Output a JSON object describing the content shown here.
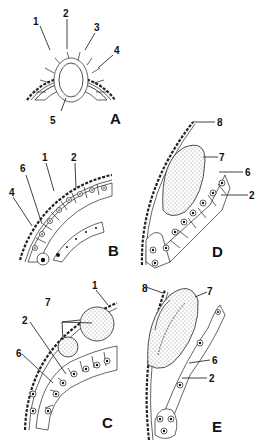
{
  "figure": {
    "panels": [
      {
        "id": "A",
        "label": "A",
        "callouts": [
          "1",
          "2",
          "3",
          "4",
          "5"
        ]
      },
      {
        "id": "B",
        "label": "B",
        "callouts": [
          "6",
          "1",
          "2",
          "4"
        ]
      },
      {
        "id": "C",
        "label": "C",
        "callouts": [
          "1",
          "7",
          "2",
          "6"
        ]
      },
      {
        "id": "D",
        "label": "D",
        "callouts": [
          "8",
          "7",
          "6",
          "2"
        ]
      },
      {
        "id": "E",
        "label": "E",
        "callouts": [
          "8",
          "7",
          "6",
          "2"
        ]
      }
    ]
  },
  "labels": {
    "A": {
      "panel": "A",
      "n1": "1",
      "n2": "2",
      "n3": "3",
      "n4": "4",
      "n5": "5"
    },
    "B": {
      "panel": "B",
      "n6": "6",
      "n1": "1",
      "n2": "2",
      "n4": "4"
    },
    "C": {
      "panel": "C",
      "n1": "1",
      "n7": "7",
      "n2": "2",
      "n6": "6"
    },
    "D": {
      "panel": "D",
      "n8": "8",
      "n7": "7",
      "n6": "6",
      "n2": "2"
    },
    "E": {
      "panel": "E",
      "n8": "8",
      "n7": "7",
      "n6": "6",
      "n2": "2"
    }
  }
}
